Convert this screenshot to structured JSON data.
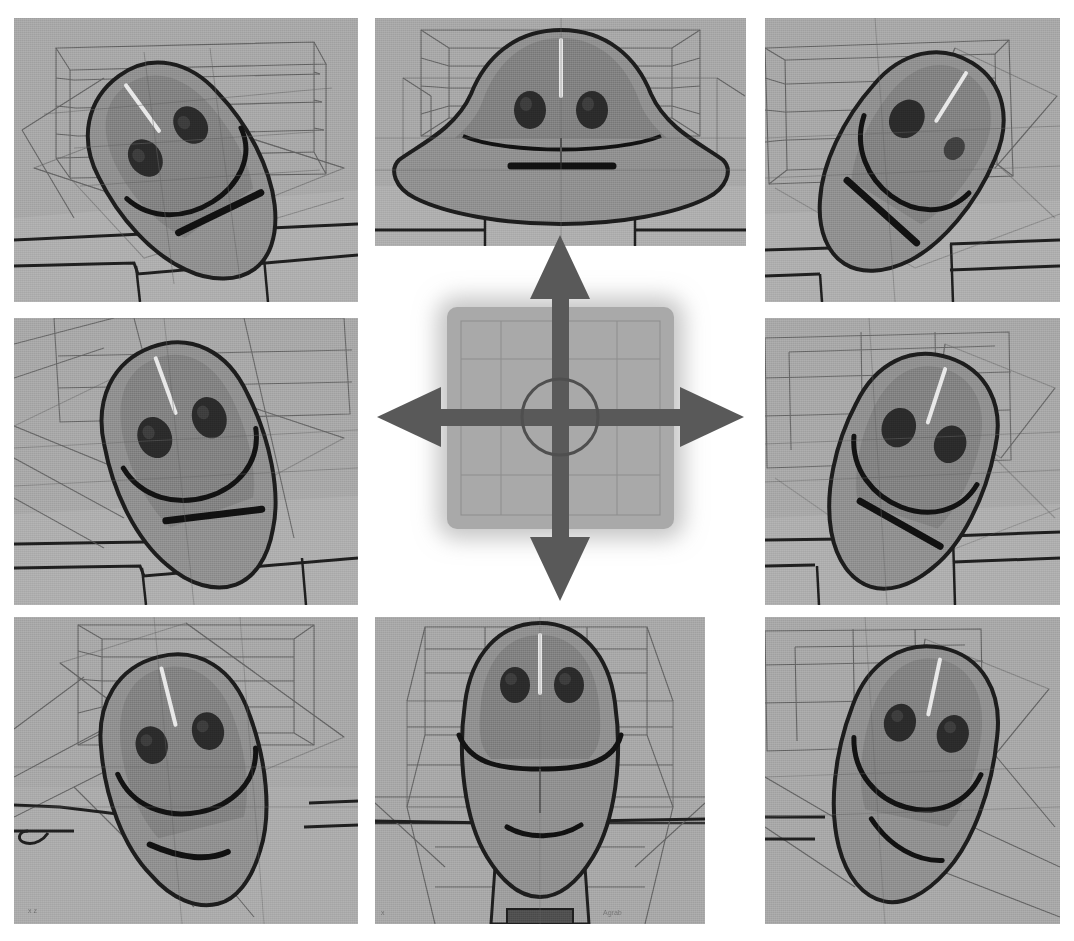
{
  "figure": {
    "layout": "3x3 grid of rendered viewpoints around a central directional pad",
    "background_color": "#ffffff",
    "panel_background_color": "#a6a6a6",
    "body_fill_color": "#8e8e8e",
    "head_fill_color": "#7e7e7e",
    "outline_color": "#1f1f1f",
    "wireframe_color": "#4a4a4a",
    "arrow_color": "#595959",
    "pad_color": "#a9a9a9"
  },
  "controller": {
    "name": "directional-pad",
    "center_label": "",
    "arrows": [
      {
        "direction": "up",
        "glyph": "▲",
        "label": ""
      },
      {
        "direction": "down",
        "glyph": "▼",
        "label": ""
      },
      {
        "direction": "left",
        "glyph": "◀",
        "label": ""
      },
      {
        "direction": "right",
        "glyph": "▶",
        "label": ""
      }
    ]
  },
  "panels": [
    {
      "id": "top-left",
      "row": 0,
      "col": 0,
      "position": {
        "x": 14,
        "y": 18,
        "w": 344,
        "h": 284
      },
      "view": "up-left",
      "caption": "",
      "head_rotation_deg": -38,
      "eyes_visible": 2,
      "mouth": "slanted-line",
      "overlay_text": ""
    },
    {
      "id": "top-center",
      "row": 0,
      "col": 1,
      "position": {
        "x": 375,
        "y": 18,
        "w": 371,
        "h": 228
      },
      "view": "up",
      "caption": "",
      "head_rotation_deg": 0,
      "eyes_visible": 2,
      "mouth": "horizontal-line",
      "overlay_text": ""
    },
    {
      "id": "top-right",
      "row": 0,
      "col": 2,
      "position": {
        "x": 765,
        "y": 18,
        "w": 295,
        "h": 284
      },
      "view": "up-right",
      "caption": "",
      "head_rotation_deg": 34,
      "eyes_visible": 1,
      "mouth": "slanted-line",
      "overlay_text": ""
    },
    {
      "id": "middle-left",
      "row": 1,
      "col": 0,
      "position": {
        "x": 14,
        "y": 318,
        "w": 344,
        "h": 287
      },
      "view": "left",
      "caption": "",
      "head_rotation_deg": -22,
      "eyes_visible": 2,
      "mouth": "slanted-line",
      "overlay_text": ""
    },
    {
      "id": "middle-right",
      "row": 1,
      "col": 2,
      "position": {
        "x": 765,
        "y": 318,
        "w": 295,
        "h": 287
      },
      "view": "right",
      "caption": "",
      "head_rotation_deg": 20,
      "eyes_visible": 2,
      "mouth": "slanted-line",
      "overlay_text": ""
    },
    {
      "id": "bottom-left",
      "row": 2,
      "col": 0,
      "position": {
        "x": 14,
        "y": 617,
        "w": 344,
        "h": 307
      },
      "view": "down-left",
      "caption": "",
      "head_rotation_deg": -16,
      "eyes_visible": 2,
      "mouth": "curved-line",
      "overlay_text": "x z"
    },
    {
      "id": "bottom-center",
      "row": 2,
      "col": 1,
      "position": {
        "x": 375,
        "y": 617,
        "w": 330,
        "h": 307
      },
      "view": "down",
      "caption": "",
      "head_rotation_deg": 0,
      "eyes_visible": 2,
      "mouth": "curved-line",
      "overlay_text": "x",
      "overlay_text_right": "Agrab"
    },
    {
      "id": "bottom-right",
      "row": 2,
      "col": 2,
      "position": {
        "x": 765,
        "y": 617,
        "w": 295,
        "h": 307
      },
      "view": "down-right",
      "caption": "",
      "head_rotation_deg": 14,
      "eyes_visible": 2,
      "mouth": "curved-line",
      "overlay_text": ""
    }
  ]
}
